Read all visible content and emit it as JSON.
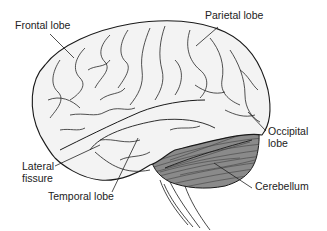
{
  "diagram": {
    "colors": {
      "background": "#ffffff",
      "cerebrum_fill": "#f3f3f3",
      "outline": "#1a1a1a",
      "cerebellum_fill": "#8a8a8a",
      "text": "#222222"
    },
    "labels": [
      {
        "id": "frontal",
        "text": "Frontal lobe"
      },
      {
        "id": "parietal",
        "text": "Parietal lobe"
      },
      {
        "id": "occipital_1",
        "text": "Occipital"
      },
      {
        "id": "occipital_2",
        "text": "lobe"
      },
      {
        "id": "lateral_1",
        "text": "Lateral"
      },
      {
        "id": "lateral_2",
        "text": "fissure"
      },
      {
        "id": "temporal",
        "text": "Temporal lobe"
      },
      {
        "id": "cerebellum",
        "text": "Cerebellum"
      }
    ]
  }
}
